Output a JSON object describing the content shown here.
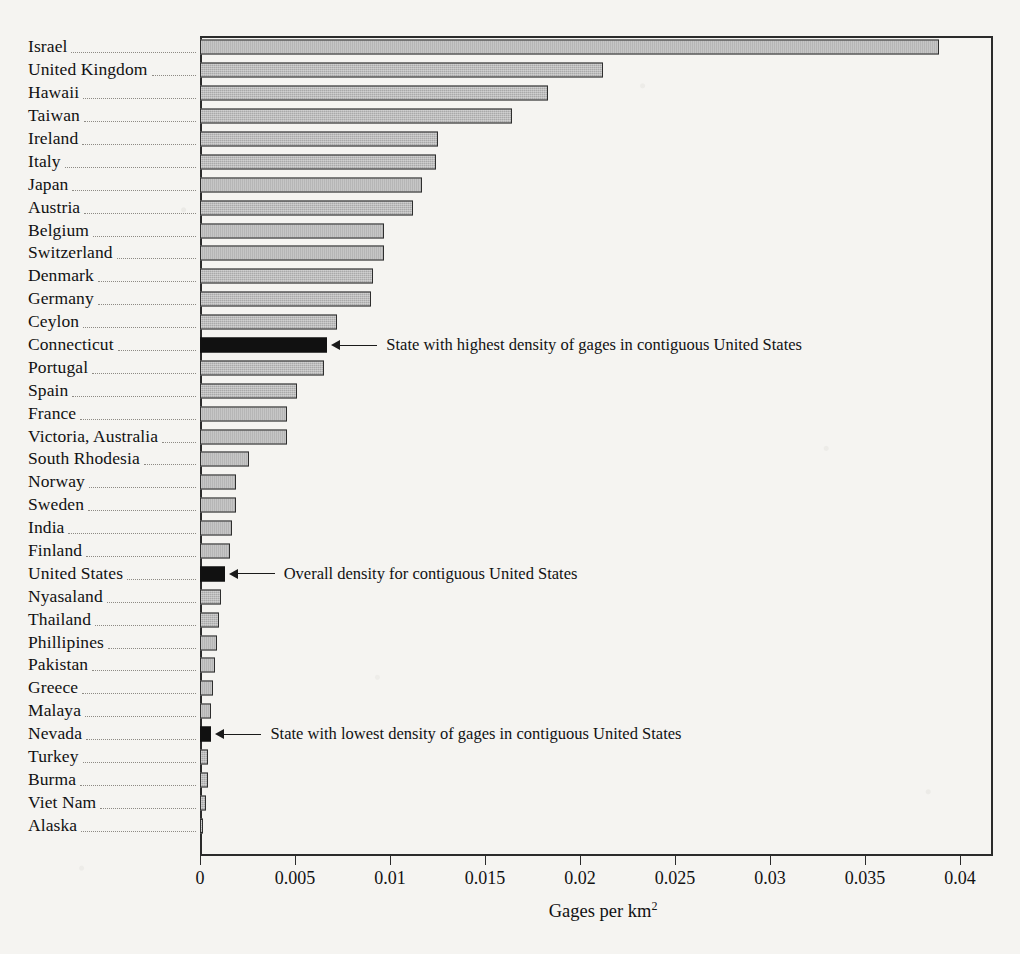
{
  "chart_data": {
    "type": "bar",
    "orientation": "horizontal",
    "title": "",
    "xlabel": "Gages per km2",
    "xlabel_display": "Gages per km",
    "xlabel_superscript": "2",
    "ylabel": "",
    "xlim": [
      0,
      0.04
    ],
    "xticks": [
      0,
      0.005,
      0.01,
      0.015,
      0.02,
      0.025,
      0.03,
      0.035,
      0.04
    ],
    "xticklabels": [
      "0",
      "0.005",
      "0.01",
      "0.015",
      "0.02",
      "0.025",
      "0.03",
      "0.035",
      "0.04"
    ],
    "grid": false,
    "legend": "none",
    "bar_fill_default": "#a9a9a9",
    "bar_fill_highlight": "#111111",
    "bar_edge_color": "#2e2e2e",
    "categories": [
      "Israel",
      "United Kingdom",
      "Hawaii",
      "Taiwan",
      "Ireland",
      "Italy",
      "Japan",
      "Austria",
      "Belgium",
      "Switzerland",
      "Denmark",
      "Germany",
      "Ceylon",
      "Connecticut",
      "Portugal",
      "Spain",
      "France",
      "Victoria, Australia",
      "South Rhodesia",
      "Norway",
      "Sweden",
      "India",
      "Finland",
      "United States",
      "Nyasaland",
      "Thailand",
      "Phillipines",
      "Pakistan",
      "Greece",
      "Malaya",
      "Nevada",
      "Turkey",
      "Burma",
      "Viet Nam",
      "Alaska"
    ],
    "values": [
      0.0389,
      0.0212,
      0.0183,
      0.0164,
      0.0125,
      0.0124,
      0.0117,
      0.0112,
      0.0097,
      0.0097,
      0.0091,
      0.009,
      0.0072,
      0.0067,
      0.0065,
      0.0051,
      0.0046,
      0.0046,
      0.0026,
      0.0019,
      0.0019,
      0.0017,
      0.0016,
      0.0013,
      0.0011,
      0.001,
      0.0009,
      0.0008,
      0.0007,
      0.0006,
      0.0006,
      0.0004,
      0.0004,
      0.0003,
      0.0001
    ],
    "highlighted": [
      "Connecticut",
      "United States",
      "Nevada"
    ],
    "annotations": [
      {
        "category": "Connecticut",
        "text": "State with highest density of gages in contiguous United States"
      },
      {
        "category": "United States",
        "text": "Overall density for contiguous United States"
      },
      {
        "category": "Nevada",
        "text": "State with lowest density of gages in contiguous United States"
      }
    ]
  }
}
